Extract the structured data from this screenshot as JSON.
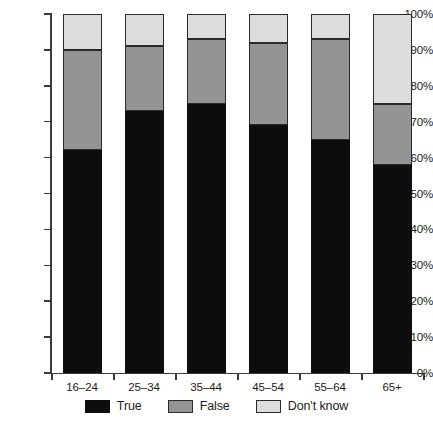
{
  "chart_data": {
    "type": "bar",
    "stacked": true,
    "stack_mode": "percent",
    "title": "",
    "subtitle": "",
    "xlabel": "",
    "ylabel": "",
    "categories": [
      "16–24",
      "25–34",
      "35–44",
      "45–54",
      "55–64",
      "65+"
    ],
    "series": [
      {
        "name": "True",
        "color": "#0d0d0d",
        "values": [
          62,
          73,
          75,
          69,
          65,
          58
        ]
      },
      {
        "name": "False",
        "color": "#949494",
        "values": [
          28,
          18,
          18,
          23,
          28,
          17
        ]
      },
      {
        "name": "Don't know",
        "color": "#dcdcdc",
        "values": [
          10,
          9,
          7,
          8,
          7,
          25
        ]
      }
    ],
    "cumulative_tops": {
      "true": [
        62,
        73,
        75,
        69,
        65,
        58
      ],
      "false": [
        90,
        91,
        93,
        92,
        93,
        75
      ],
      "dk": [
        100,
        100,
        100,
        100,
        100,
        100
      ]
    },
    "ylim": [
      0,
      100
    ],
    "ytick_values": [
      0,
      10,
      20,
      30,
      40,
      50,
      60,
      70,
      80,
      90,
      100
    ],
    "ytick_labels": [
      "0%",
      "10%",
      "20%",
      "30%",
      "40%",
      "50%",
      "60%",
      "70%",
      "80%",
      "90%",
      "100%"
    ],
    "grid": false,
    "legend_position": "bottom",
    "legend": [
      {
        "label": "True",
        "color": "#0d0d0d"
      },
      {
        "label": "False",
        "color": "#949494"
      },
      {
        "label": "Don't know",
        "color": "#dcdcdc"
      }
    ]
  },
  "axis": {
    "y_labels": [
      "100%",
      "90%",
      "80%",
      "70%",
      "60%",
      "50%",
      "40%",
      "30%",
      "20%",
      "10%",
      "0%"
    ],
    "x_labels": [
      "16–24",
      "25–34",
      "35–44",
      "45–54",
      "55–64",
      "65+"
    ]
  }
}
